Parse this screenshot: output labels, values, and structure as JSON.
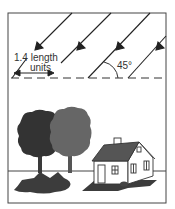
{
  "diagram": {
    "title": "",
    "labels": {
      "length_line1": "1.4 length",
      "length_line2": "units",
      "angle": "45°"
    },
    "elements": {
      "sun_rays": {
        "count": 4,
        "angle_deg": 45,
        "direction": "down-left"
      },
      "reference_line": "dashed horizontal",
      "trees": 2,
      "house": 1
    },
    "colors": {
      "line": "#333333",
      "tree_dark": "#3a3a3a",
      "tree_light": "#6a6a6a",
      "shadow": "#3c3c3c",
      "roof": "#555555"
    }
  }
}
